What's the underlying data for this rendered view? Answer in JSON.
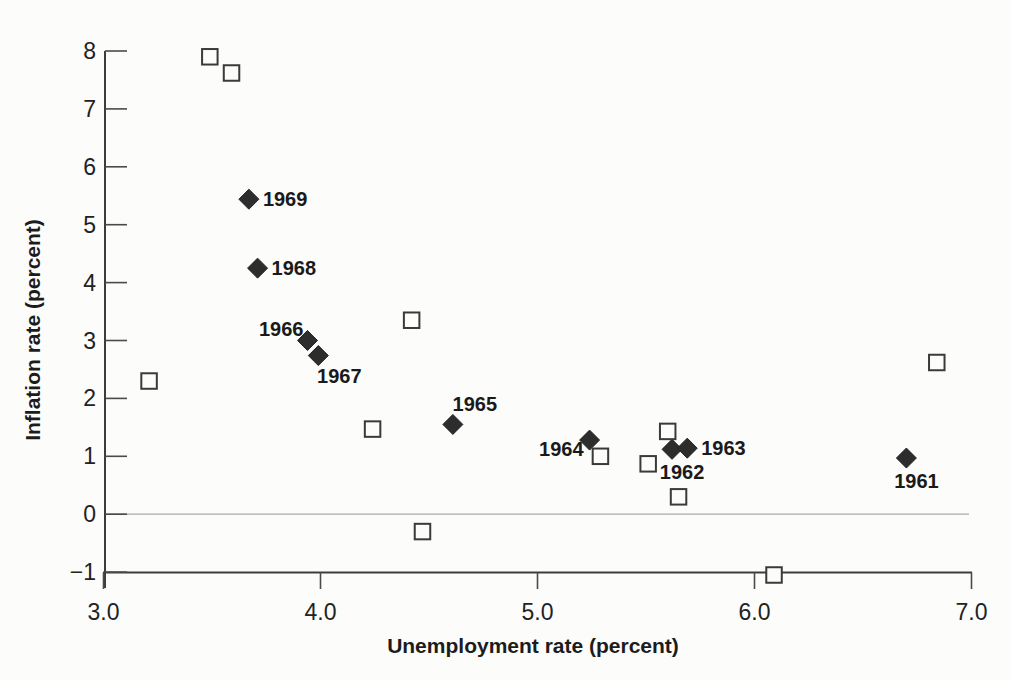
{
  "figure": {
    "background_color": "#fcfcfb",
    "axis_color": "#3c3c3c",
    "text_color": "#1c1c1c",
    "zero_line_color": "#ababab"
  },
  "chart_data": {
    "type": "scatter",
    "title": "",
    "xlabel": "Unemployment rate (percent)",
    "ylabel": "Inflation rate (percent)",
    "xlim": [
      3.0,
      7.0
    ],
    "ylim": [
      -1,
      8
    ],
    "grid": "off",
    "legend": "none",
    "reference_line_y": 0,
    "x_ticks": [
      {
        "value": 3.0,
        "label": "3.0"
      },
      {
        "value": 4.0,
        "label": "4.0"
      },
      {
        "value": 5.0,
        "label": "5.0"
      },
      {
        "value": 6.0,
        "label": "6.0"
      },
      {
        "value": 7.0,
        "label": "7.0"
      }
    ],
    "y_ticks": [
      {
        "value": 8,
        "label": "8"
      },
      {
        "value": 7,
        "label": "7"
      },
      {
        "value": 6,
        "label": "6"
      },
      {
        "value": 5,
        "label": "5"
      },
      {
        "value": 4,
        "label": "4"
      },
      {
        "value": 3,
        "label": "3"
      },
      {
        "value": 2,
        "label": "2"
      },
      {
        "value": 1,
        "label": "1"
      },
      {
        "value": 0,
        "label": "0"
      },
      {
        "value": -1,
        "label": "−1"
      }
    ],
    "series": [
      {
        "name": "Labeled years 1961–1969",
        "marker": "filled-diamond",
        "color": "#2d2d2d",
        "points": [
          {
            "x": 6.7,
            "y": 0.97,
            "label": "1961",
            "label_pos": "below"
          },
          {
            "x": 5.62,
            "y": 1.12,
            "label": "1962",
            "label_pos": "below"
          },
          {
            "x": 5.69,
            "y": 1.14,
            "label": "1963",
            "label_pos": "right"
          },
          {
            "x": 5.24,
            "y": 1.28,
            "label": "1964",
            "label_pos": "left"
          },
          {
            "x": 4.61,
            "y": 1.55,
            "label": "1965",
            "label_pos": "above-right"
          },
          {
            "x": 3.94,
            "y": 3.0,
            "label": "1966",
            "label_pos": "left-above"
          },
          {
            "x": 3.99,
            "y": 2.74,
            "label": "1967",
            "label_pos": "below-right"
          },
          {
            "x": 3.71,
            "y": 4.25,
            "label": "1968",
            "label_pos": "right"
          },
          {
            "x": 3.67,
            "y": 5.44,
            "label": "1969",
            "label_pos": "right"
          }
        ]
      },
      {
        "name": "Unlabeled years",
        "marker": "open-square",
        "color": "#3a3a3a",
        "points": [
          {
            "x": 3.49,
            "y": 7.9
          },
          {
            "x": 3.59,
            "y": 7.62
          },
          {
            "x": 3.21,
            "y": 2.3
          },
          {
            "x": 4.24,
            "y": 1.47
          },
          {
            "x": 4.42,
            "y": 3.35
          },
          {
            "x": 4.47,
            "y": -0.3
          },
          {
            "x": 5.29,
            "y": 1.0
          },
          {
            "x": 5.51,
            "y": 0.87
          },
          {
            "x": 5.6,
            "y": 1.43
          },
          {
            "x": 5.65,
            "y": 0.3
          },
          {
            "x": 6.09,
            "y": -1.05
          },
          {
            "x": 6.84,
            "y": 2.62
          }
        ]
      }
    ]
  }
}
